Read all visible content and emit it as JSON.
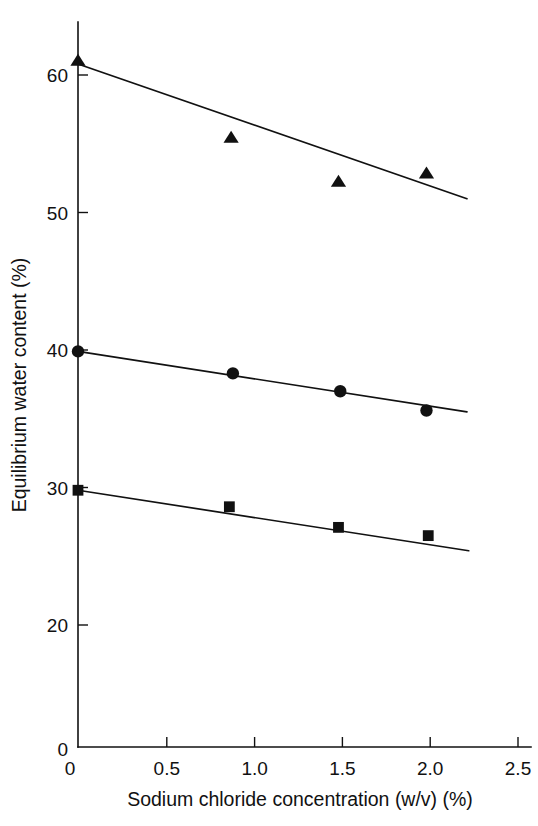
{
  "chart_data": {
    "type": "scatter",
    "title": "",
    "xlabel": "Sodium chloride concentration (w/v) (%)",
    "ylabel": "Equilibrium water content (%)",
    "xlim": [
      0,
      2.5
    ],
    "ylim": [
      20,
      62
    ],
    "grid": false,
    "legend": "none",
    "axis_break": "y-axis is broken between 0 and 20",
    "x_ticks": [
      "0",
      "0.5",
      "1.0",
      "1.5",
      "2.0",
      "2.5"
    ],
    "x_tick_values": [
      0,
      0.5,
      1.0,
      1.5,
      2.0,
      2.5
    ],
    "y_ticks": [
      "0",
      "20",
      "30",
      "40",
      "50",
      "60"
    ],
    "y_tick_values": [
      0,
      20,
      30,
      40,
      50,
      60
    ],
    "series": [
      {
        "name": "series-triangle",
        "marker": "triangle",
        "color": "#111111",
        "x": [
          0.0,
          0.87,
          1.48,
          1.98
        ],
        "values": [
          61.0,
          55.4,
          52.2,
          52.8
        ],
        "fit_line": {
          "x": [
            0.0,
            2.21
          ],
          "y": [
            60.8,
            51.0
          ]
        }
      },
      {
        "name": "series-circle",
        "marker": "circle",
        "color": "#111111",
        "x": [
          0.0,
          0.88,
          1.49,
          1.98
        ],
        "values": [
          39.9,
          38.3,
          37.0,
          35.6
        ],
        "fit_line": {
          "x": [
            0.0,
            2.21
          ],
          "y": [
            39.9,
            35.5
          ]
        }
      },
      {
        "name": "series-square",
        "marker": "square",
        "color": "#111111",
        "x": [
          0.0,
          0.86,
          1.48,
          1.99
        ],
        "values": [
          29.8,
          28.6,
          27.1,
          26.5
        ],
        "fit_line": {
          "x": [
            0.0,
            2.22
          ],
          "y": [
            29.8,
            25.4
          ]
        }
      }
    ]
  },
  "axes": {
    "x_label": "Sodium chloride concentration (w/v) (%)",
    "y_label": "Equilibrium water content (%)"
  },
  "x_tick_labels": [
    "0",
    "0.5",
    "1.0",
    "1.5",
    "2.0",
    "2.5"
  ],
  "y_tick_labels": [
    "60",
    "50",
    "40",
    "30",
    "20",
    "0"
  ]
}
